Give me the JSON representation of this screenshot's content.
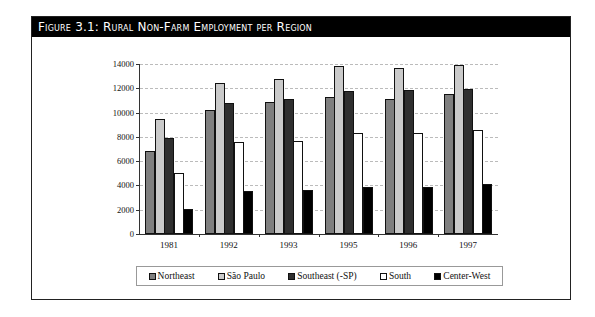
{
  "figure": {
    "title": "Figure 3.1: Rural Non-Farm Employment per Region"
  },
  "colors": {
    "Northeast": "#7f7f7f",
    "Sao Paulo": "#cacaca",
    "Southeast": "#2f2f2f",
    "South": "#ffffff",
    "Center-West": "#000000"
  },
  "chart_data": {
    "type": "bar",
    "title": "Figure 3.1: Rural Non-Farm Employment per Region",
    "xlabel": "",
    "ylabel": "",
    "categories": [
      "1981",
      "1992",
      "1993",
      "1995",
      "1996",
      "1997"
    ],
    "series": [
      {
        "name": "Northeast",
        "values": [
          6850,
          10250,
          10850,
          11250,
          11100,
          11500
        ]
      },
      {
        "name": "São Paulo",
        "values": [
          9500,
          12450,
          12750,
          13800,
          13700,
          13950
        ]
      },
      {
        "name": "Southeast (-SP)",
        "values": [
          7900,
          10800,
          11100,
          11750,
          11850,
          11950
        ]
      },
      {
        "name": "South",
        "values": [
          5000,
          7550,
          7700,
          8350,
          8350,
          8550
        ]
      },
      {
        "name": "Center-West",
        "values": [
          2050,
          3550,
          3600,
          3900,
          3900,
          4150
        ]
      }
    ],
    "ylim": [
      0,
      14000
    ],
    "yticks": [
      "0",
      "2000",
      "4000",
      "6000",
      "8000",
      "10000",
      "12000",
      "14000"
    ],
    "grid": true,
    "legend_position": "bottom"
  },
  "legend": {
    "items": [
      "Northeast",
      "São Paulo",
      "Southeast (-SP)",
      "South",
      "Center-West"
    ]
  }
}
